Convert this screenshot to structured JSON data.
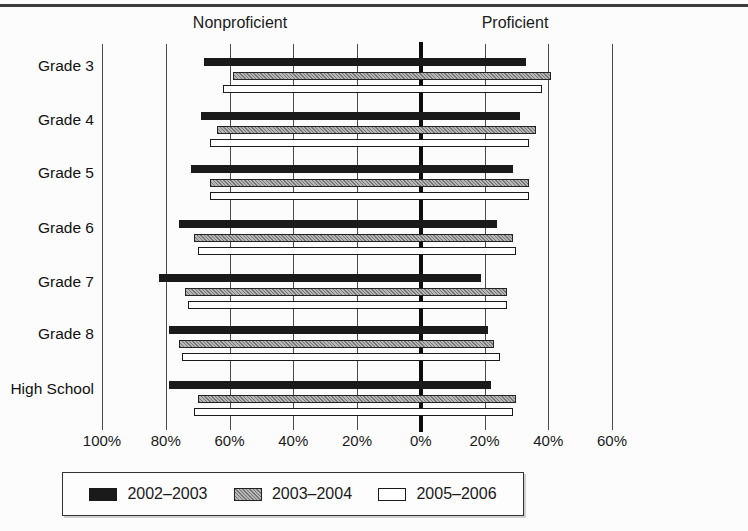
{
  "page": {
    "background": "#fcfcfc",
    "top_rule_color": "#3c3c3c"
  },
  "chart_data": {
    "type": "bar",
    "orientation": "horizontal-diverging",
    "left_header": "Nonproficient",
    "right_header": "Proficient",
    "categories": [
      "Grade 3",
      "Grade 4",
      "Grade 5",
      "Grade 6",
      "Grade 7",
      "Grade 8",
      "High School"
    ],
    "axis": {
      "min": -100,
      "max": 60,
      "unit": "%",
      "grid": true,
      "zero_line_emphasized": true,
      "ticks": [
        {
          "value": -100,
          "label": "100%"
        },
        {
          "value": -80,
          "label": "80%"
        },
        {
          "value": -60,
          "label": "60%"
        },
        {
          "value": -40,
          "label": "40%"
        },
        {
          "value": -20,
          "label": "20%"
        },
        {
          "value": 0,
          "label": "0%"
        },
        {
          "value": 20,
          "label": "20%"
        },
        {
          "value": 40,
          "label": "40%"
        },
        {
          "value": 60,
          "label": "60%"
        }
      ]
    },
    "series": [
      {
        "name": "2002–2003",
        "style": "solid-black",
        "color": "#1a1a1a",
        "nonproficient": [
          68,
          69,
          72,
          76,
          82,
          79,
          79
        ],
        "proficient": [
          33,
          31,
          29,
          24,
          19,
          21,
          22
        ]
      },
      {
        "name": "2003–2004",
        "style": "hatched-gray",
        "color": "#9a9a9a",
        "nonproficient": [
          59,
          64,
          66,
          71,
          74,
          76,
          70
        ],
        "proficient": [
          41,
          36,
          34,
          29,
          27,
          23,
          30
        ]
      },
      {
        "name": "2005–2006",
        "style": "white-outline",
        "color": "#ffffff",
        "nonproficient": [
          62,
          66,
          66,
          70,
          73,
          75,
          71
        ],
        "proficient": [
          38,
          34,
          34,
          30,
          27,
          25,
          29
        ]
      }
    ],
    "legend": {
      "position": "bottom"
    }
  }
}
